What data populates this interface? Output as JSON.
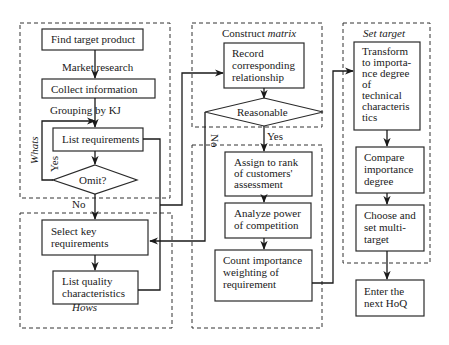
{
  "groups": {
    "whats": "Whats",
    "hows": "Hows",
    "construct_matrix": {
      "prefix": "Construct ",
      "italic": "matrix"
    },
    "set_target": "Set target"
  },
  "nodes": {
    "find_target": [
      "Find target product"
    ],
    "collect_info": [
      "Collect information"
    ],
    "list_req": [
      "List requirements"
    ],
    "omit": [
      "Omit?"
    ],
    "select_key": [
      "Select key",
      "requirements"
    ],
    "list_quality": [
      "List quality",
      "characteristics"
    ],
    "record": [
      "Record",
      "corresponding",
      "relationship"
    ],
    "reasonable": [
      "Reasonable"
    ],
    "assign_rank": [
      "Assign to rank",
      "of customers'",
      "assessment"
    ],
    "analyze_power": [
      "Analyze power",
      "of competition"
    ],
    "count_importance": [
      "Count importance",
      "weighting of",
      "requirement"
    ],
    "transform": [
      "Transform",
      "to importa-",
      "nce degree",
      "of",
      "technical",
      "characteris",
      "tics"
    ],
    "compare": [
      "Compare",
      "importance",
      "degree"
    ],
    "choose": [
      "Choose and",
      "set multi-",
      "target"
    ],
    "enter": [
      "Enter the",
      "next HoQ"
    ]
  },
  "edge_labels": {
    "market_research": "Market research",
    "grouping_kj": "Grouping by KJ",
    "yes_omit": "Yes",
    "no_omit": "No",
    "no_reasonable": "No",
    "yes_reasonable": "Yes"
  }
}
